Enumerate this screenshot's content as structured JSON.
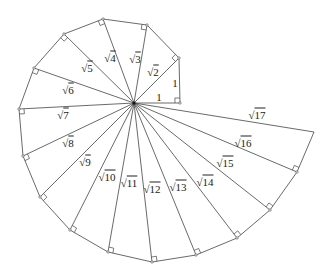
{
  "diagram": {
    "center": [
      134,
      103
    ],
    "stroke_color": "#444444",
    "label_color": "#222222",
    "vertices": [
      {
        "n": 1,
        "x": 180,
        "y": 103
      },
      {
        "n": 2,
        "x": 179,
        "y": 58
      },
      {
        "n": 3,
        "x": 147,
        "y": 25
      },
      {
        "n": 4,
        "x": 103,
        "y": 19
      },
      {
        "n": 5,
        "x": 64,
        "y": 34
      },
      {
        "n": 6,
        "x": 34,
        "y": 68
      },
      {
        "n": 7,
        "x": 19,
        "y": 109
      },
      {
        "n": 8,
        "x": 23,
        "y": 156
      },
      {
        "n": 9,
        "x": 40,
        "y": 197
      },
      {
        "n": 10,
        "x": 70,
        "y": 230
      },
      {
        "n": 11,
        "x": 108,
        "y": 252
      },
      {
        "n": 12,
        "x": 152,
        "y": 262
      },
      {
        "n": 13,
        "x": 196,
        "y": 255
      },
      {
        "n": 14,
        "x": 237,
        "y": 238
      },
      {
        "n": 15,
        "x": 270,
        "y": 210
      },
      {
        "n": 16,
        "x": 297,
        "y": 172
      },
      {
        "n": 17,
        "x": 314,
        "y": 132
      }
    ],
    "labels": [
      {
        "id": "one-base",
        "text": "1",
        "x": 159,
        "y": 97
      },
      {
        "id": "one-side",
        "text": "1",
        "x": 175,
        "y": 83
      },
      {
        "id": "sqrt2",
        "radical": "√",
        "radicand": "2",
        "x": 153,
        "y": 72
      },
      {
        "id": "sqrt3",
        "radical": "√",
        "radicand": "3",
        "x": 135,
        "y": 59
      },
      {
        "id": "sqrt4",
        "radical": "√",
        "radicand": "4",
        "x": 110,
        "y": 58
      },
      {
        "id": "sqrt5",
        "radical": "√",
        "radicand": "5",
        "x": 87,
        "y": 68
      },
      {
        "id": "sqrt6",
        "radical": "√",
        "radicand": "6",
        "x": 68,
        "y": 90
      },
      {
        "id": "sqrt7",
        "radical": "√",
        "radicand": "7",
        "x": 63,
        "y": 115
      },
      {
        "id": "sqrt8",
        "radical": "√",
        "radicand": "8",
        "x": 68,
        "y": 143
      },
      {
        "id": "sqrt9",
        "radical": "√",
        "radicand": "9",
        "x": 85,
        "y": 162
      },
      {
        "id": "sqrt10",
        "radical": "√",
        "radicand": "10",
        "x": 107,
        "y": 177
      },
      {
        "id": "sqrt11",
        "radical": "√",
        "radicand": "11",
        "x": 129,
        "y": 183
      },
      {
        "id": "sqrt12",
        "radical": "√",
        "radicand": "12",
        "x": 152,
        "y": 189
      },
      {
        "id": "sqrt13",
        "radical": "√",
        "radicand": "13",
        "x": 178,
        "y": 187
      },
      {
        "id": "sqrt14",
        "radical": "√",
        "radicand": "14",
        "x": 205,
        "y": 182
      },
      {
        "id": "sqrt15",
        "radical": "√",
        "radicand": "15",
        "x": 225,
        "y": 163
      },
      {
        "id": "sqrt16",
        "radical": "√",
        "radicand": "16",
        "x": 243,
        "y": 143
      },
      {
        "id": "sqrt17",
        "radical": "√",
        "radicand": "17",
        "x": 257,
        "y": 115
      }
    ],
    "right_angle_marker_size": 5
  }
}
